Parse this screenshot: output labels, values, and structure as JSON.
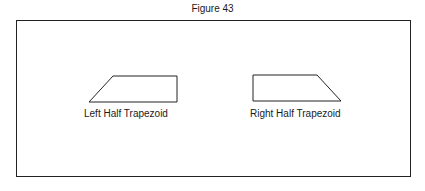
{
  "figure": {
    "title": "Figure 43",
    "shapes": [
      {
        "name": "left-half-trapezoid",
        "label": "Left Half Trapezoid",
        "points": "113,76 177,76 177,102 89,102"
      },
      {
        "name": "right-half-trapezoid",
        "label": "Right Half Trapezoid",
        "points": "253,75 317,75 341,101 253,101"
      }
    ],
    "stroke_color": "#222222"
  }
}
